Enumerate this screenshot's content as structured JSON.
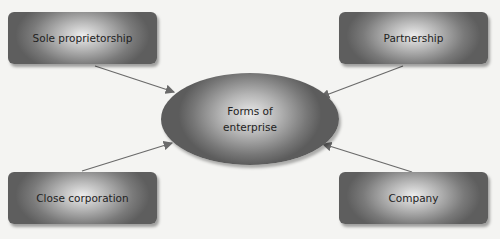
{
  "center": {
    "line1": "Forms of",
    "line2": "enterprise"
  },
  "nodes": [
    {
      "id": "sole",
      "label": "Sole proprietorship"
    },
    {
      "id": "partnership",
      "label": "Partnership"
    },
    {
      "id": "close",
      "label": "Close corporation"
    },
    {
      "id": "company",
      "label": "Company"
    }
  ],
  "colors": {
    "arrow": "#6a6a6a",
    "background": "#f4f4f2"
  }
}
